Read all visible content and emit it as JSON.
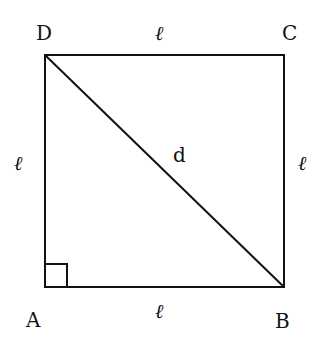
{
  "diagram": {
    "type": "square-with-diagonal",
    "colors": {
      "stroke": "#111111",
      "background": "#ffffff"
    },
    "vertices": [
      {
        "id": "D",
        "label": "D",
        "x": 45,
        "y": 55
      },
      {
        "id": "C",
        "label": "C",
        "x": 284,
        "y": 55
      },
      {
        "id": "B",
        "label": "B",
        "x": 284,
        "y": 287
      },
      {
        "id": "A",
        "label": "A",
        "x": 45,
        "y": 287
      }
    ],
    "sides": {
      "top": "ℓ",
      "bottom": "ℓ",
      "left": "ℓ",
      "right": "ℓ"
    },
    "diagonal": {
      "from": "D",
      "to": "B",
      "label": "d"
    },
    "right_angle_marker": {
      "at": "A"
    }
  }
}
